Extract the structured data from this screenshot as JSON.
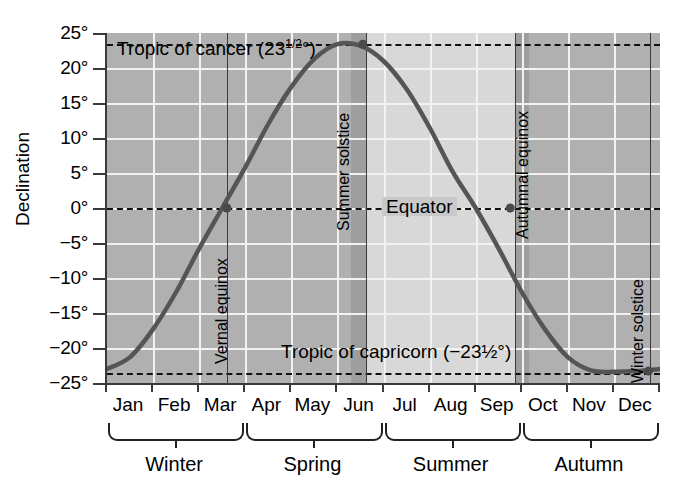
{
  "chart_data": {
    "type": "line",
    "title": "",
    "xlabel": "",
    "ylabel": "Declination",
    "ylim": [
      -25,
      25
    ],
    "xlim": [
      0,
      12
    ],
    "grid": true,
    "legend": "none",
    "y_ticks": [
      "25°",
      "20°",
      "15°",
      "10°",
      "5°",
      "0°",
      "−5°",
      "−10°",
      "−15°",
      "−20°",
      "−25°"
    ],
    "y_tick_values": [
      25,
      20,
      15,
      10,
      5,
      0,
      -5,
      -10,
      -15,
      -20,
      -25
    ],
    "categories": [
      "Jan",
      "Feb",
      "Mar",
      "Apr",
      "May",
      "Jun",
      "Jul",
      "Aug",
      "Sep",
      "Oct",
      "Nov",
      "Dec"
    ],
    "series": [
      {
        "name": "Solar declination",
        "x": [
          0.0,
          0.5,
          1.0,
          1.5,
          2.0,
          2.5,
          3.0,
          3.5,
          4.0,
          4.5,
          5.0,
          5.5,
          6.0,
          6.5,
          7.0,
          7.5,
          8.0,
          8.5,
          9.0,
          9.5,
          10.0,
          10.5,
          11.0,
          11.5,
          12.0
        ],
        "values": [
          -23.0,
          -21.3,
          -17.3,
          -12.0,
          -5.8,
          0.0,
          5.8,
          12.0,
          17.3,
          21.3,
          23.4,
          23.2,
          21.0,
          17.0,
          11.5,
          5.2,
          0.0,
          -5.8,
          -12.0,
          -17.3,
          -21.3,
          -23.2,
          -23.4,
          -23.3,
          -23.0
        ]
      }
    ],
    "markers": [
      {
        "label": "Vernal equinox",
        "x": 2.6,
        "y": 0
      },
      {
        "label": "Summer solstice",
        "x": 5.55,
        "y": 23.4
      },
      {
        "label": "Autumnal equinox",
        "x": 8.75,
        "y": 0
      },
      {
        "label": "Winter solstice",
        "x": 11.75,
        "y": -23.3
      }
    ],
    "reference_lines": [
      {
        "label": "Tropic of cancer (23½°)",
        "value": 23.5,
        "style": "dashed"
      },
      {
        "label": "Equator",
        "value": 0,
        "style": "dashed"
      },
      {
        "label": "Tropic of capricorn (−23½°)",
        "value": -23.5,
        "style": "dashed"
      }
    ],
    "shaded_bands": [
      {
        "name": "summer-light-band",
        "x_start": 5.65,
        "x_end": 8.85,
        "color": "#d8d8d8"
      },
      {
        "name": "solstice-marker-band",
        "x_start": 5.3,
        "x_end": 5.65,
        "color": "#9e9e9e"
      },
      {
        "name": "equinox-marker-band",
        "x_start": 8.85,
        "x_end": 9.15,
        "color": "#9e9e9e"
      }
    ]
  },
  "axis": {
    "y_title": "Declination",
    "y_ticks": [
      {
        "label": "25°",
        "value": 25
      },
      {
        "label": "20°",
        "value": 20
      },
      {
        "label": "15°",
        "value": 15
      },
      {
        "label": "10°",
        "value": 10
      },
      {
        "label": "5°",
        "value": 5
      },
      {
        "label": "0°",
        "value": 0
      },
      {
        "label": "−5°",
        "value": -5
      },
      {
        "label": "−10°",
        "value": -10
      },
      {
        "label": "−15°",
        "value": -15
      },
      {
        "label": "−20°",
        "value": -20
      },
      {
        "label": "−25°",
        "value": -25
      }
    ],
    "x_ticks": [
      {
        "label": "Jan"
      },
      {
        "label": "Feb"
      },
      {
        "label": "Mar"
      },
      {
        "label": "Apr"
      },
      {
        "label": "May"
      },
      {
        "label": "Jun"
      },
      {
        "label": "Jul"
      },
      {
        "label": "Aug"
      },
      {
        "label": "Sep"
      },
      {
        "label": "Oct"
      },
      {
        "label": "Nov"
      },
      {
        "label": "Dec"
      }
    ]
  },
  "annotations": {
    "tropic_of_cancer": "Tropic of cancer (23",
    "tropic_of_cancer_frac": "1/2",
    "tropic_of_cancer_end": "°)",
    "tropic_of_cancer_full": "Tropic of cancer (23½°)",
    "equator": "Equator",
    "tropic_of_capricorn_full": "Tropic of capricorn (−23½°)",
    "vernal_equinox": "Vernal equinox",
    "summer_solstice": "Summer solstice",
    "autumnal_equinox": "Autumnal equinox",
    "winter_solstice": "Winter solstice"
  },
  "seasons": [
    {
      "label": "Winter",
      "start_month": 0,
      "end_month": 3
    },
    {
      "label": "Spring",
      "start_month": 3,
      "end_month": 6
    },
    {
      "label": "Summer",
      "start_month": 6,
      "end_month": 9
    },
    {
      "label": "Autumn",
      "start_month": 9,
      "end_month": 12
    }
  ],
  "colors": {
    "plot_background": "#b0b0b0",
    "light_band": "#d8d8d8",
    "marker_band": "#9e9e9e",
    "gridline": "#f2f2f2",
    "curve": "#555555",
    "axis": "#3a3a3a",
    "text": "#000000"
  }
}
